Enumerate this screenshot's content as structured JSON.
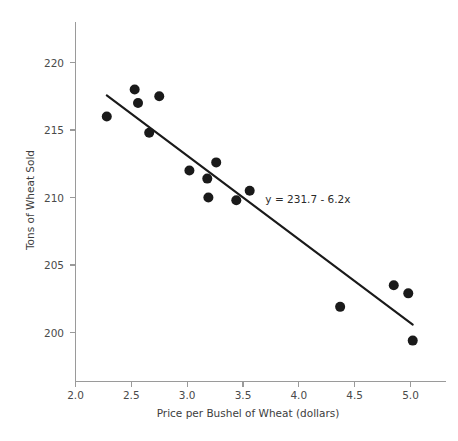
{
  "chart_data": {
    "type": "scatter",
    "title": "",
    "xlabel": "Price per Bushel of Wheat (dollars)",
    "ylabel": "Tons of Wheat Sold",
    "xlim": [
      1.88,
      5.22
    ],
    "ylim": [
      197.2,
      222.2
    ],
    "grid": false,
    "legend": null,
    "x_ticks": [
      "2.0",
      "2.5",
      "3.0",
      "3.5",
      "4.0",
      "4.5",
      "5.0"
    ],
    "x_tick_values": [
      2.0,
      2.5,
      3.0,
      3.5,
      4.0,
      4.5,
      5.0
    ],
    "y_ticks": [
      "220",
      "215",
      "210",
      "205",
      "200"
    ],
    "y_tick_values": [
      220,
      215,
      210,
      205,
      200
    ],
    "x": [
      2.28,
      2.53,
      2.56,
      2.75,
      2.66,
      3.02,
      3.18,
      3.26,
      3.19,
      3.44,
      3.56,
      4.37,
      4.85,
      4.98,
      5.02
    ],
    "y": [
      216.0,
      218.0,
      217.0,
      217.5,
      214.8,
      212.0,
      211.4,
      212.6,
      210.0,
      209.8,
      210.5,
      201.9,
      203.5,
      202.9,
      199.4
    ],
    "points": [
      {
        "x": 2.28,
        "y": 216.0
      },
      {
        "x": 2.53,
        "y": 218.0
      },
      {
        "x": 2.56,
        "y": 217.0
      },
      {
        "x": 2.75,
        "y": 217.5
      },
      {
        "x": 2.66,
        "y": 214.8
      },
      {
        "x": 3.02,
        "y": 212.0
      },
      {
        "x": 3.18,
        "y": 211.4
      },
      {
        "x": 3.26,
        "y": 212.6
      },
      {
        "x": 3.19,
        "y": 210.0
      },
      {
        "x": 3.44,
        "y": 209.8
      },
      {
        "x": 3.56,
        "y": 210.5
      },
      {
        "x": 4.37,
        "y": 201.9
      },
      {
        "x": 4.85,
        "y": 203.5
      },
      {
        "x": 4.98,
        "y": 202.9
      },
      {
        "x": 5.02,
        "y": 199.4
      }
    ],
    "marker": {
      "shape": "circle",
      "size_px": 5.6,
      "color": "#1a1a1a"
    },
    "trendline": {
      "label": "y = 231.7 - 6.2x",
      "intercept": 231.7,
      "slope": -6.2,
      "color": "#1a1a1a",
      "x_start": 2.28,
      "x_end": 5.02,
      "y_start": 217.56,
      "y_end": 200.58
    },
    "annotations": [
      {
        "text": "y = 231.7 - 6.2x",
        "x": 3.7,
        "y": 209.6
      }
    ],
    "axis_color": "#9a9a9a",
    "tick_label_color": "#4a4a4a",
    "background": "#ffffff"
  }
}
